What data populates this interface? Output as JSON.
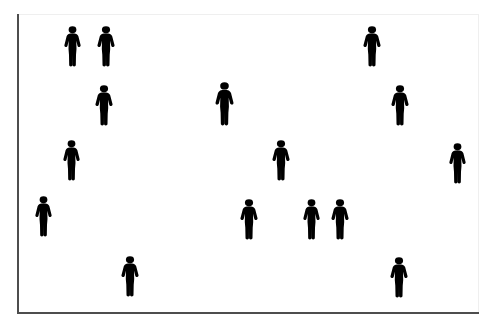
{
  "scene": {
    "title": "Crowd of human silhouettes",
    "background_color": "#ffffff",
    "figure_color": "#000000",
    "frame": {
      "x": 17,
      "y": 14,
      "width": 462,
      "height": 300,
      "border_color": "#4d4d4d",
      "faint_border_color": "#efefef"
    },
    "figure_count": "16",
    "icon_name": "person-silhouette-icon",
    "figures": [
      {
        "id": "person-01",
        "x": 63,
        "y": 26,
        "w": 19,
        "h": 41,
        "row": "1"
      },
      {
        "id": "person-02",
        "x": 96,
        "y": 26,
        "w": 20,
        "h": 41,
        "row": "1"
      },
      {
        "id": "person-03",
        "x": 362,
        "y": 26,
        "w": 20,
        "h": 41,
        "row": "1"
      },
      {
        "id": "person-04",
        "x": 94,
        "y": 85,
        "w": 20,
        "h": 41,
        "row": "2"
      },
      {
        "id": "person-05",
        "x": 214,
        "y": 82,
        "w": 21,
        "h": 44,
        "row": "2"
      },
      {
        "id": "person-06",
        "x": 390,
        "y": 85,
        "w": 20,
        "h": 41,
        "row": "2"
      },
      {
        "id": "person-07",
        "x": 62,
        "y": 140,
        "w": 19,
        "h": 41,
        "row": "3"
      },
      {
        "id": "person-08",
        "x": 271,
        "y": 140,
        "w": 20,
        "h": 41,
        "row": "3"
      },
      {
        "id": "person-09",
        "x": 448,
        "y": 143,
        "w": 19,
        "h": 41,
        "row": "3"
      },
      {
        "id": "person-10",
        "x": 34,
        "y": 196,
        "w": 19,
        "h": 41,
        "row": "4"
      },
      {
        "id": "person-11",
        "x": 239,
        "y": 199,
        "w": 20,
        "h": 41,
        "row": "4"
      },
      {
        "id": "person-12",
        "x": 302,
        "y": 199,
        "w": 19,
        "h": 41,
        "row": "4"
      },
      {
        "id": "person-13",
        "x": 330,
        "y": 199,
        "w": 20,
        "h": 41,
        "row": "4"
      },
      {
        "id": "person-14",
        "x": 120,
        "y": 256,
        "w": 20,
        "h": 41,
        "row": "5"
      },
      {
        "id": "person-15",
        "x": 389,
        "y": 257,
        "w": 20,
        "h": 41,
        "row": "5"
      },
      {
        "id": "person-16",
        "x": 448,
        "y": 143,
        "w": 0,
        "h": 0,
        "row": "hidden"
      }
    ]
  }
}
